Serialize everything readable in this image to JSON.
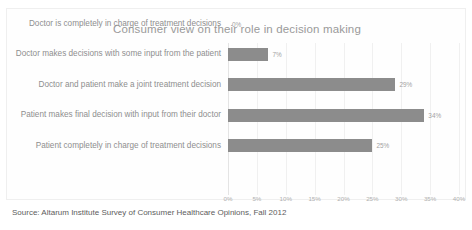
{
  "chart_data": {
    "type": "bar",
    "orientation": "horizontal",
    "title": "Consumer view on their role in decision making",
    "xlabel": "",
    "ylabel": "",
    "xlim": [
      0,
      40
    ],
    "grid": true,
    "legend": false,
    "bar_color": "#8c8c8c",
    "categories": [
      "Doctor is completely in charge of treatment decisions",
      "Doctor makes decisions with some input from the patient",
      "Doctor and patient make a joint treatment decision",
      "Patient makes final decision with input from their doctor",
      "Patient completely in charge of treatment decisions"
    ],
    "values": [
      0,
      7,
      29,
      34,
      25
    ],
    "value_labels": [
      "0%",
      "7%",
      "29%",
      "34%",
      "25%"
    ],
    "xticks": [
      0,
      5,
      10,
      15,
      20,
      25,
      30,
      35,
      40
    ],
    "xticklabels": [
      "0%",
      "5%",
      "10%",
      "15%",
      "20%",
      "25%",
      "30%",
      "35%",
      "40%"
    ]
  },
  "footer": {
    "source": "Source:  Altarum Institute Survey of Consumer Healthcare Opinions, Fall 2012"
  }
}
